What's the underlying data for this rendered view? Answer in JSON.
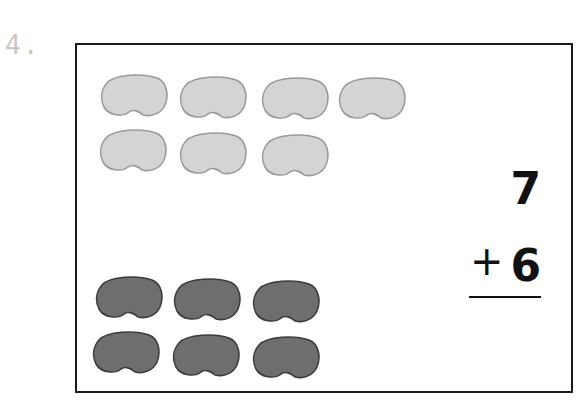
{
  "problem": {
    "number_label": "4.",
    "addend_top": "7",
    "operator": "+",
    "addend_bottom": "6"
  },
  "beans": {
    "light_color": "#d4d4d4",
    "light_edge": "#9a9a9a",
    "dark_color": "#6e6e6e",
    "dark_edge": "#3c3c3c",
    "light": [
      {
        "x": 22,
        "y": 28
      },
      {
        "x": 101,
        "y": 30
      },
      {
        "x": 183,
        "y": 31
      },
      {
        "x": 260,
        "y": 31
      },
      {
        "x": 21,
        "y": 83
      },
      {
        "x": 101,
        "y": 86
      },
      {
        "x": 183,
        "y": 88
      }
    ],
    "dark": [
      {
        "x": 17,
        "y": 230
      },
      {
        "x": 95,
        "y": 232
      },
      {
        "x": 174,
        "y": 234
      },
      {
        "x": 14,
        "y": 285
      },
      {
        "x": 94,
        "y": 288
      },
      {
        "x": 174,
        "y": 290
      }
    ]
  }
}
